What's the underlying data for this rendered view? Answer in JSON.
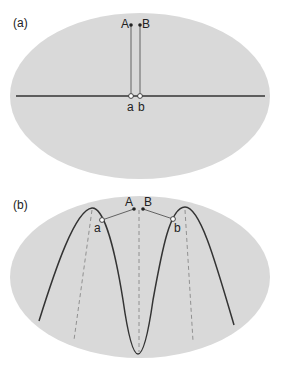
{
  "colors": {
    "ellipse_fill": "#d9d9d9",
    "line": "#333333",
    "thin_line": "#555555",
    "dashed": "#888888",
    "background": "#ffffff"
  },
  "panel_a": {
    "label": "(a)",
    "points": {
      "A": "A",
      "B": "B",
      "a": "a",
      "b": "b"
    }
  },
  "panel_b": {
    "label": "(b)",
    "points": {
      "A": "A",
      "B": "B",
      "a": "a",
      "b": "b"
    }
  }
}
